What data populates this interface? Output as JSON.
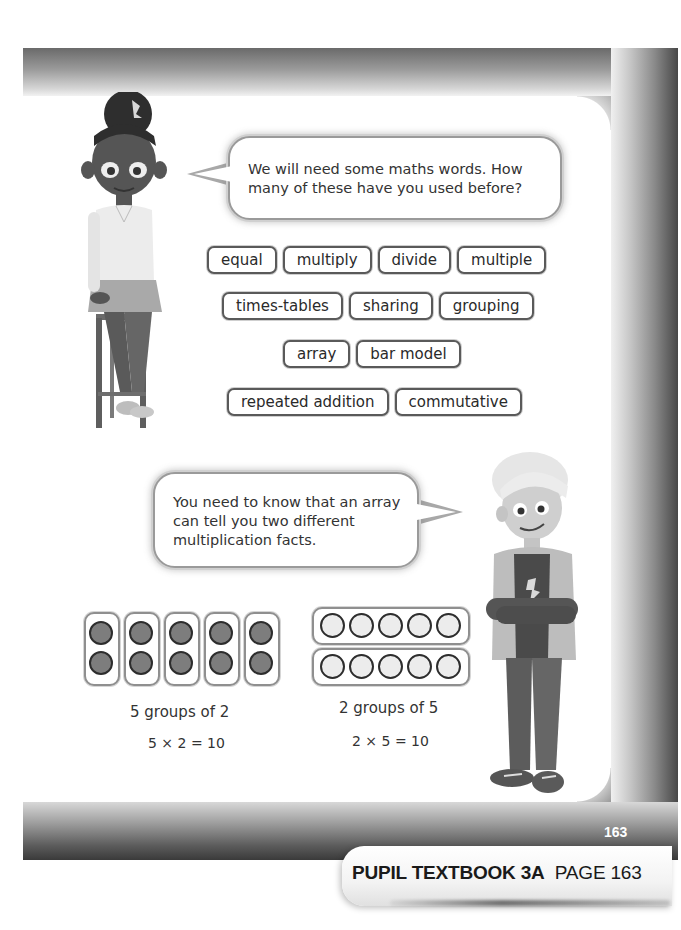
{
  "page": {
    "page_number": "163",
    "tab_label_bold": "PUPIL TEXTBOOK 3A",
    "tab_label_regular": "PAGE 163"
  },
  "speech_bubbles": [
    {
      "speaker": "girl",
      "text": "We will need some maths words. How many of these have you used before?"
    },
    {
      "speaker": "boy",
      "text": "You need to know that an array can tell you two different multiplication facts."
    }
  ],
  "vocabulary": {
    "rows": [
      [
        "equal",
        "multiply",
        "divide",
        "multiple"
      ],
      [
        "times-tables",
        "sharing",
        "grouping"
      ],
      [
        "array",
        "bar model"
      ],
      [
        "repeated addition",
        "commutative"
      ]
    ]
  },
  "arrays": [
    {
      "layout": "5 columns of 2",
      "counter_color": "dark grey",
      "caption": "5 groups of 2",
      "equation": "5 × 2 = 10"
    },
    {
      "layout": "2 rows of 5",
      "counter_color": "light grey",
      "caption": "2 groups of 5",
      "equation": "2 × 5 = 10"
    }
  ],
  "illustrations": {
    "girl": "girl-sitting-on-stool",
    "boy": "boy-standing-arms-crossed"
  }
}
